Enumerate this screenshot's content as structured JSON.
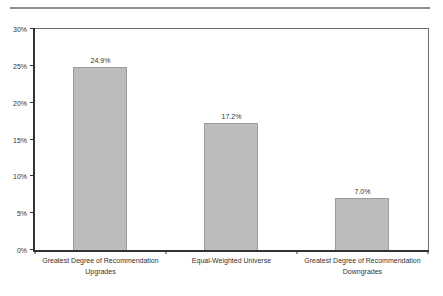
{
  "chart_data": {
    "type": "bar",
    "title": "",
    "xlabel": "",
    "ylabel": "",
    "categories": [
      "Greatest Degree of Recommendation Upgrades",
      "Equal-Weighted Universe",
      "Greatest Degree of Recommendation Downgrades"
    ],
    "values": [
      24.9,
      17.2,
      7.0
    ],
    "value_labels": [
      "24.9%",
      "17.2%",
      "7.0%"
    ],
    "ylim": [
      0,
      30
    ],
    "ytick_step": 5,
    "ytick_labels": [
      "0%",
      "5%",
      "10%",
      "15%",
      "20%",
      "25%",
      "30%"
    ],
    "grid": false,
    "legend_position": "none",
    "bar_color": "#bcbcbc",
    "bar_border_color": "#9b9b9b",
    "axis_color": "#333333",
    "divider_color": "#8f8f8f"
  }
}
